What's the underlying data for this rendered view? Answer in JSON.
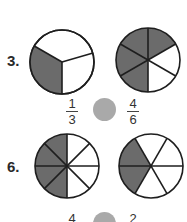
{
  "problems": [
    {
      "number": "3.",
      "left_circle": {
        "parts": 3,
        "shaded": 1
      },
      "right_circle": {
        "parts": 6,
        "shaded": 4
      },
      "left_fraction": {
        "numerator": "1",
        "denominator": "3"
      },
      "right_fraction": {
        "numerator": "4",
        "denominator": "6"
      }
    },
    {
      "number": "6.",
      "left_circle": {
        "parts": 8,
        "shaded": 4
      },
      "right_circle": {
        "parts": 6,
        "shaded": 2
      },
      "left_fraction": {
        "numerator": "4",
        "denominator": ""
      },
      "right_fraction": {
        "numerator": "2",
        "denominator": ""
      }
    }
  ],
  "colors": {
    "shade": "#6b6b6b",
    "outline": "#1e1e1e",
    "comparison_dot": "#a9a9a9"
  }
}
